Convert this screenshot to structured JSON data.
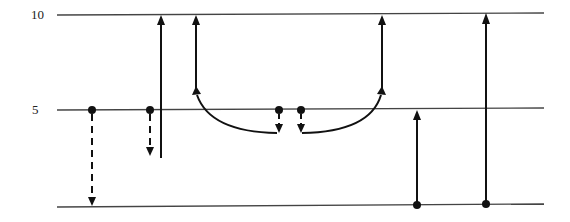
{
  "diagram": {
    "type": "energy-level-transition-diagram",
    "levels": [
      {
        "label": "10",
        "y": 15
      },
      {
        "label": "5",
        "y": 110
      },
      {
        "label": "",
        "y": 206
      }
    ],
    "level_labels": {
      "top": "10",
      "middle": "5"
    },
    "colors": {
      "line": "#333333",
      "arrow": "#111111",
      "background": "#ffffff"
    },
    "transitions": [
      {
        "id": "t1",
        "style": "dashed",
        "direction": "down",
        "x": 92,
        "from": "5",
        "to": "0"
      },
      {
        "id": "t2",
        "style": "dashed",
        "direction": "down",
        "x": 150,
        "from": "5",
        "to": "partial"
      },
      {
        "id": "t3",
        "style": "solid",
        "direction": "up",
        "x": 161,
        "from": "partial",
        "to": "10"
      },
      {
        "id": "t4",
        "style": "dashed",
        "direction": "down",
        "x": 279,
        "from": "5",
        "to": "partial"
      },
      {
        "id": "t5",
        "style": "solid-curve",
        "direction": "up",
        "from_x": 277,
        "to_x": 196,
        "to": "10"
      },
      {
        "id": "t6",
        "style": "dashed",
        "direction": "down",
        "x": 301,
        "from": "5",
        "to": "partial"
      },
      {
        "id": "t7",
        "style": "solid-curve",
        "direction": "up",
        "from_x": 302,
        "to_x": 382,
        "to": "10"
      },
      {
        "id": "t8",
        "style": "solid",
        "direction": "up",
        "x": 417,
        "from": "0",
        "to": "5"
      },
      {
        "id": "t9",
        "style": "solid",
        "direction": "up",
        "x": 486,
        "from": "0",
        "to": "10"
      }
    ]
  }
}
